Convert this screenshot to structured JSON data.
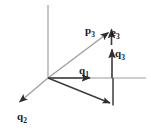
{
  "figure": {
    "background_color": "#ffffff",
    "width": 151,
    "height": 132,
    "origin": {
      "x": 48,
      "y": 78
    }
  },
  "colors": {
    "axis": "#b8b8b8",
    "light_vector": "#9a9a9a",
    "dark_vector": "#3a3a3a",
    "label": "#1a1a1a"
  },
  "axes": [
    {
      "name": "vertical-axis",
      "style": "light-gray",
      "x1": 48,
      "y1": 5,
      "x2": 48,
      "y2": 78
    },
    {
      "name": "horizontal-axis",
      "style": "light-gray",
      "x1": 48,
      "y1": 78,
      "x2": 146,
      "y2": 78
    }
  ],
  "vectors": [
    {
      "id": "p3",
      "label_base": "p",
      "label_sub": "3",
      "label_text": "p3",
      "style": "light-gray",
      "x1": 48,
      "y1": 78,
      "x2": 110,
      "y2": 31,
      "arrowhead": true,
      "description": "diagonal vector from origin up-right to tip"
    },
    {
      "id": "e3",
      "label_base": "e",
      "label_sub": "3",
      "label_text": "e3",
      "style": "dark",
      "x1": 111,
      "y1": 46,
      "x2": 111,
      "y2": 27,
      "arrowhead": true,
      "description": "short vertical vector at top of q3 stack"
    },
    {
      "id": "q3",
      "label_base": "q",
      "label_sub": "3",
      "label_text": "q3",
      "style": "dark",
      "x1": 112,
      "y1": 78,
      "x2": 112,
      "y2": 47,
      "arrowhead": true,
      "description": "vertical vector rising from horizontal axis"
    },
    {
      "id": "q1",
      "label_base": "q",
      "label_sub": "1",
      "label_text": "q1",
      "style": "dark",
      "x1": 48,
      "y1": 78,
      "x2": 93,
      "y2": 78,
      "arrowhead": true,
      "description": "horizontal vector pointing right along axis"
    },
    {
      "id": "q2",
      "label_base": "q",
      "label_sub": "2",
      "label_text": "q2",
      "style": "light-gray",
      "x1": 48,
      "y1": 78,
      "x2": 17,
      "y2": 104,
      "arrowhead": true,
      "description": "vector pointing down-left"
    },
    {
      "id": "projection",
      "label_base": "",
      "label_sub": "",
      "label_text": "",
      "style": "dark",
      "x1": 48,
      "y1": 78,
      "x2": 112,
      "y2": 104,
      "arrowhead": true,
      "description": "unlabeled dark vector pointing down-right to foot of perpendicular"
    },
    {
      "id": "dropline",
      "label_base": "",
      "label_sub": "",
      "label_text": "",
      "style": "dark-thin",
      "x1": 113,
      "y1": 78,
      "x2": 113,
      "y2": 105,
      "arrowhead": false,
      "description": "vertical segment connecting axis down to projection tip"
    }
  ],
  "labels": [
    {
      "id": "label-p3",
      "base": "p",
      "sub": "3"
    },
    {
      "id": "label-e3",
      "base": "e",
      "sub": "3"
    },
    {
      "id": "label-q3",
      "base": "q",
      "sub": "3"
    },
    {
      "id": "label-q1",
      "base": "q",
      "sub": "1"
    },
    {
      "id": "label-q2",
      "base": "q",
      "sub": "2"
    }
  ]
}
